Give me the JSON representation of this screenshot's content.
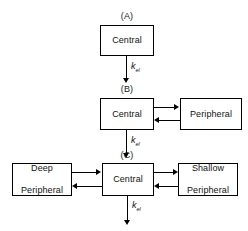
{
  "diagram": {
    "panels": [
      {
        "id": "A",
        "label": "(A)",
        "boxes": [
          {
            "name": "central",
            "label": "Central"
          }
        ],
        "elimination": {
          "symbol": "k",
          "subscript": "el"
        }
      },
      {
        "id": "B",
        "label": "(B)",
        "boxes": [
          {
            "name": "central",
            "label": "Central"
          },
          {
            "name": "peripheral",
            "label": "Peripheral"
          }
        ],
        "elimination": {
          "symbol": "k",
          "subscript": "el"
        }
      },
      {
        "id": "C",
        "label": "(C)",
        "boxes": [
          {
            "name": "deep-peripheral",
            "label_line1": "Deep",
            "label_line2": "Peripheral"
          },
          {
            "name": "central",
            "label": "Central"
          },
          {
            "name": "shallow-peripheral",
            "label_line1": "Shallow",
            "label_line2": "Peripheral"
          }
        ],
        "elimination": {
          "symbol": "k",
          "subscript": "el"
        }
      }
    ],
    "colors": {
      "stroke": "#000000",
      "text": "#111111",
      "background": "#ffffff"
    }
  }
}
